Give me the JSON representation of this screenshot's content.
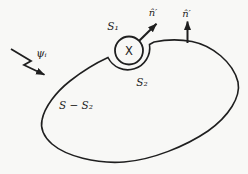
{
  "diagram": {
    "labels": {
      "incident_wave": "ψᵢ",
      "normal_left": "n̂′",
      "normal_right": "n̂′",
      "source_region": "S₁",
      "indentation_surface": "S₂",
      "outer_surface": "S − S₂",
      "source_mark": "X"
    },
    "colors": {
      "ink": "#1f1f1f",
      "background": "#f8f8f6"
    }
  }
}
